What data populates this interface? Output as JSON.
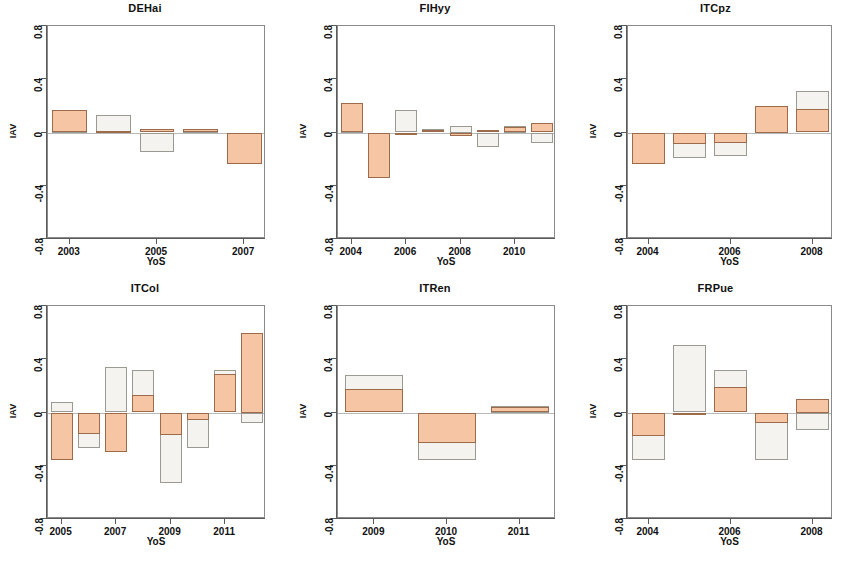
{
  "figure": {
    "axis_y_label": "IAV",
    "axis_x_label": "YoS",
    "y_ticks": [
      "0.8",
      "0.4",
      "0",
      "-0.4",
      "-0.8"
    ],
    "y_tick_values": [
      0.8,
      0.4,
      0,
      -0.4,
      -0.8
    ],
    "ylim": [
      -0.8,
      0.8
    ],
    "colors": {
      "orange_fill": "#f6c5a4",
      "orange_border": "#9c6b4c",
      "white_fill": "#f4f3ef",
      "white_border": "#9a9a93",
      "axis": "#5a5a5a",
      "zero_line": "#b9b9b9"
    }
  },
  "chart_data": [
    {
      "type": "bar",
      "title": "DEHai",
      "xlabel": "YoS",
      "ylabel": "IAV",
      "ylim": [
        -0.8,
        0.8
      ],
      "grid": false,
      "legend": "none",
      "x": [
        2003,
        2004,
        2005,
        2006,
        2007
      ],
      "xticks": [
        2003,
        2005,
        2007
      ],
      "xticklabels": [
        "2003",
        "2005",
        "2007"
      ],
      "series": [
        {
          "name": "orange",
          "values": [
            0.17,
            0.01,
            0.03,
            0.03,
            -0.24
          ]
        },
        {
          "name": "white",
          "values": [
            0.01,
            0.13,
            -0.15,
            0.01,
            -0.01
          ]
        }
      ]
    },
    {
      "type": "bar",
      "title": "FIHyy",
      "xlabel": "YoS",
      "ylabel": "IAV",
      "ylim": [
        -0.8,
        0.8
      ],
      "grid": false,
      "legend": "none",
      "x": [
        2004,
        2005,
        2006,
        2007,
        2008,
        2009,
        2010,
        2011
      ],
      "xticks": [
        2004,
        2006,
        2008,
        2010
      ],
      "xticklabels": [
        "2004",
        "2006",
        "2008",
        "2010"
      ],
      "series": [
        {
          "name": "orange",
          "values": [
            0.22,
            -0.34,
            -0.01,
            0.02,
            -0.03,
            0.02,
            0.04,
            0.07
          ]
        },
        {
          "name": "white",
          "values": [
            0.05,
            -0.19,
            0.17,
            0.03,
            0.05,
            -0.11,
            0.05,
            -0.08
          ]
        }
      ]
    },
    {
      "type": "bar",
      "title": "ITCpz",
      "xlabel": "YoS",
      "ylabel": "IAV",
      "ylim": [
        -0.8,
        0.8
      ],
      "grid": false,
      "legend": "none",
      "x": [
        2004,
        2005,
        2006,
        2007,
        2008
      ],
      "xticks": [
        2004,
        2006,
        2008
      ],
      "xticklabels": [
        "2004",
        "2006",
        "2008"
      ],
      "series": [
        {
          "name": "orange",
          "values": [
            -0.24,
            -0.09,
            -0.08,
            0.2,
            0.18
          ]
        },
        {
          "name": "white",
          "values": [
            -0.11,
            -0.19,
            -0.18,
            0.1,
            0.31
          ]
        }
      ]
    },
    {
      "type": "bar",
      "title": "ITCol",
      "xlabel": "YoS",
      "ylabel": "IAV",
      "ylim": [
        -0.8,
        0.8
      ],
      "grid": false,
      "legend": "none",
      "x": [
        2005,
        2006,
        2007,
        2008,
        2009,
        2010,
        2011,
        2012
      ],
      "xticks": [
        2005,
        2007,
        2009,
        2011
      ],
      "xticklabels": [
        "2005",
        "2007",
        "2009",
        "2011"
      ],
      "series": [
        {
          "name": "orange",
          "values": [
            -0.36,
            -0.16,
            -0.3,
            0.13,
            -0.17,
            -0.06,
            0.29,
            0.6
          ]
        },
        {
          "name": "white",
          "values": [
            0.08,
            -0.27,
            0.34,
            0.32,
            -0.53,
            -0.27,
            0.32,
            -0.08
          ]
        }
      ]
    },
    {
      "type": "bar",
      "title": "ITRen",
      "xlabel": "YoS",
      "ylabel": "IAV",
      "ylim": [
        -0.8,
        0.8
      ],
      "grid": false,
      "legend": "none",
      "x": [
        2009,
        2010,
        2011
      ],
      "xticks": [
        2009,
        2010,
        2011
      ],
      "xticklabels": [
        "2009",
        "2010",
        "2011"
      ],
      "series": [
        {
          "name": "orange",
          "values": [
            0.18,
            -0.23,
            0.04
          ]
        },
        {
          "name": "white",
          "values": [
            0.28,
            -0.36,
            0.05
          ]
        }
      ]
    },
    {
      "type": "bar",
      "title": "FRPue",
      "xlabel": "YoS",
      "ylabel": "IAV",
      "ylim": [
        -0.8,
        0.8
      ],
      "grid": false,
      "legend": "none",
      "x": [
        2004,
        2005,
        2006,
        2007,
        2008
      ],
      "xticks": [
        2004,
        2006,
        2008
      ],
      "xticklabels": [
        "2004",
        "2006",
        "2008"
      ],
      "series": [
        {
          "name": "orange",
          "values": [
            -0.18,
            -0.02,
            0.19,
            -0.08,
            0.1
          ]
        },
        {
          "name": "white",
          "values": [
            -0.36,
            0.51,
            0.32,
            -0.36,
            -0.13
          ]
        }
      ]
    }
  ]
}
